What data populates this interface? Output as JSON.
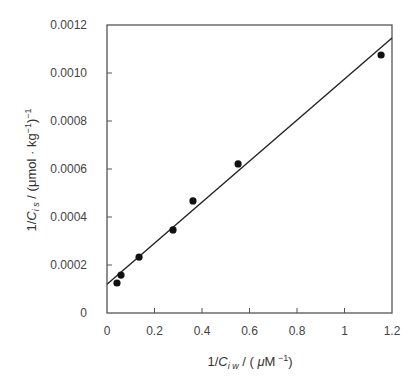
{
  "chart_data": {
    "type": "scatter",
    "title": "",
    "xlabel": "1/C_iw / ( μM^-1)",
    "xlabel_parts": {
      "pre": "1/",
      "C": "C",
      "sub": "i w",
      "post": " / ( ",
      "mu": "μ",
      "unit": "M",
      "sup": " −1",
      "close": ")"
    },
    "ylabel": "1/C_is / (μmol · kg^-1)^-1",
    "ylabel_parts": {
      "pre": "1/",
      "C": "C",
      "sub": "i s",
      "post": " / (μmol · kg",
      "sup1": "−1",
      "close": ")",
      "sup2": "−1"
    },
    "xlim": [
      0,
      1.2
    ],
    "ylim": [
      0,
      0.0012
    ],
    "x_ticks": [
      0,
      0.2,
      0.4,
      0.6,
      0.8,
      1.0,
      1.2
    ],
    "x_tick_labels": [
      "0",
      "0.2",
      "0.4",
      "0.6",
      "0.8",
      "1",
      "1.2"
    ],
    "y_ticks": [
      0,
      0.0002,
      0.0004,
      0.0006,
      0.0008,
      0.001,
      0.0012
    ],
    "y_tick_labels": [
      "0",
      "0.0002",
      "0.0004",
      "0.0006",
      "0.0008",
      "0.0010",
      "0.0012"
    ],
    "grid": false,
    "legend": null,
    "series": [
      {
        "name": "data",
        "marker": "filled-circle",
        "color": "#111111",
        "x": [
          0.042,
          0.059,
          0.135,
          0.278,
          0.362,
          0.552,
          1.154
        ],
        "y": [
          0.000125,
          0.000158,
          0.000233,
          0.000346,
          0.000467,
          0.000621,
          0.001075
        ]
      }
    ],
    "fit_line": {
      "name": "linear fit",
      "color": "#222222",
      "intercept": 0.00012,
      "slope": 0.000855,
      "x_range": [
        0,
        1.2
      ]
    }
  }
}
